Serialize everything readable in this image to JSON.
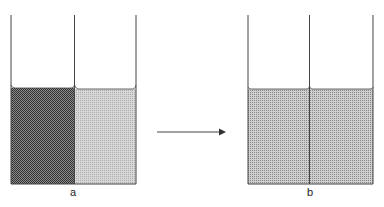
{
  "diagram": {
    "panel_a": {
      "label": "a",
      "left_fill": "dark dotted",
      "right_fill": "light dotted"
    },
    "panel_b": {
      "label": "b",
      "fill": "uniform medium dotted"
    },
    "arrow": "right-arrow"
  },
  "colors": {
    "line": "#444444",
    "dark_fill": "#555555",
    "light_fill": "#c4c4c4",
    "mixed_fill": "#a8a8a8"
  }
}
